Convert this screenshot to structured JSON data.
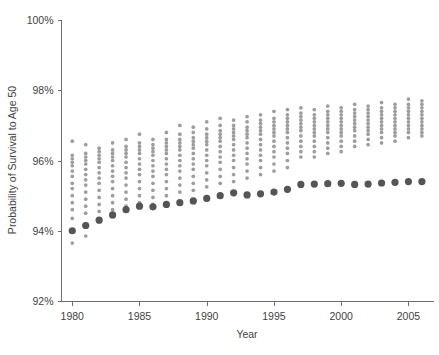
{
  "chart_data": {
    "type": "scatter",
    "title": "",
    "xlabel": "Year",
    "ylabel": "Probability of Survival to Age 50",
    "xlim": [
      1979.2,
      1986.9
    ],
    "ylim": [
      92,
      100
    ],
    "grid": false,
    "legend": "none",
    "x_ticks": [
      1980,
      1985,
      1990,
      1995,
      2000,
      2005
    ],
    "x_tick_labels": [
      "1980",
      "1985",
      "1990",
      "1995",
      "2000",
      "2005"
    ],
    "y_ticks": [
      92,
      94,
      96,
      98,
      100
    ],
    "y_tick_labels": [
      "92%",
      "94%",
      "96%",
      "98%",
      "100%"
    ],
    "x_axis_range": [
      1979.2,
      2006.9
    ],
    "units": "percent",
    "series": [
      {
        "name": "Group values by year",
        "marker": "small-dot",
        "color": "#9d9d9d",
        "points_by_year": {
          "1980": [
            96.55,
            96.15,
            96.05,
            95.95,
            95.85,
            95.7,
            95.55,
            95.35,
            95.2,
            95.0,
            94.8,
            94.6,
            94.35,
            94.0,
            93.65
          ],
          "1981": [
            96.45,
            96.2,
            96.1,
            96.0,
            95.9,
            95.75,
            95.6,
            95.45,
            95.3,
            95.1,
            94.9,
            94.7,
            94.5,
            94.2,
            93.85
          ],
          "1982": [
            96.35,
            96.25,
            96.15,
            96.05,
            95.95,
            95.8,
            95.65,
            95.5,
            95.35,
            95.15,
            94.95,
            94.75,
            94.55,
            94.3
          ],
          "1983": [
            96.5,
            96.3,
            96.2,
            96.1,
            96.0,
            95.85,
            95.7,
            95.55,
            95.4,
            95.2,
            95.0,
            94.8,
            94.6,
            94.4
          ],
          "1984": [
            96.6,
            96.4,
            96.3,
            96.2,
            96.1,
            95.95,
            95.8,
            95.65,
            95.5,
            95.3,
            95.1,
            94.9,
            94.7
          ],
          "1985": [
            96.75,
            96.5,
            96.4,
            96.3,
            96.2,
            96.05,
            95.9,
            95.75,
            95.6,
            95.4,
            95.2,
            95.0,
            94.8
          ],
          "1986": [
            96.6,
            96.45,
            96.35,
            96.25,
            96.15,
            96.0,
            95.85,
            95.7,
            95.55,
            95.35,
            95.15,
            94.95,
            94.75
          ],
          "1987": [
            96.8,
            96.6,
            96.5,
            96.4,
            96.3,
            96.2,
            96.05,
            95.9,
            95.75,
            95.6,
            95.4,
            95.2,
            95.0
          ],
          "1988": [
            97.0,
            96.75,
            96.6,
            96.5,
            96.4,
            96.3,
            96.15,
            96.0,
            95.85,
            95.7,
            95.5,
            95.3,
            95.1
          ],
          "1989": [
            96.95,
            96.8,
            96.65,
            96.55,
            96.45,
            96.35,
            96.2,
            96.05,
            95.9,
            95.75,
            95.55,
            95.35,
            95.15
          ],
          "1990": [
            97.1,
            96.9,
            96.75,
            96.65,
            96.55,
            96.45,
            96.3,
            96.15,
            96.0,
            95.85,
            95.65,
            95.45,
            95.25
          ],
          "1991": [
            97.2,
            97.0,
            96.85,
            96.75,
            96.65,
            96.55,
            96.4,
            96.25,
            96.1,
            95.95,
            95.75,
            95.55,
            95.35
          ],
          "1992": [
            97.15,
            97.0,
            96.9,
            96.8,
            96.7,
            96.6,
            96.45,
            96.3,
            96.15,
            96.0,
            95.8,
            95.6,
            95.4
          ],
          "1993": [
            97.25,
            97.1,
            96.95,
            96.85,
            96.75,
            96.65,
            96.5,
            96.35,
            96.2,
            96.05,
            95.9,
            95.7,
            95.5
          ],
          "1994": [
            97.3,
            97.15,
            97.05,
            96.95,
            96.85,
            96.75,
            96.6,
            96.45,
            96.3,
            96.15,
            96.0,
            95.8,
            95.6
          ],
          "1995": [
            97.4,
            97.2,
            97.1,
            97.0,
            96.9,
            96.8,
            96.7,
            96.55,
            96.4,
            96.25,
            96.1,
            95.9,
            95.7
          ],
          "1996": [
            97.45,
            97.3,
            97.2,
            97.1,
            97.0,
            96.9,
            96.8,
            96.65,
            96.5,
            96.35,
            96.2,
            96.0,
            95.8
          ],
          "1997": [
            97.5,
            97.35,
            97.25,
            97.15,
            97.05,
            96.95,
            96.85,
            96.7,
            96.55,
            96.4,
            96.25,
            96.1
          ],
          "1998": [
            97.45,
            97.3,
            97.2,
            97.1,
            97.0,
            96.9,
            96.8,
            96.7,
            96.55,
            96.4,
            96.25,
            96.1
          ],
          "1999": [
            97.55,
            97.4,
            97.3,
            97.2,
            97.1,
            97.0,
            96.9,
            96.8,
            96.65,
            96.5,
            96.35,
            96.2
          ],
          "2000": [
            97.5,
            97.4,
            97.3,
            97.2,
            97.1,
            97.0,
            96.9,
            96.8,
            96.7,
            96.55,
            96.4,
            96.25
          ],
          "2001": [
            97.6,
            97.45,
            97.35,
            97.25,
            97.15,
            97.05,
            96.95,
            96.85,
            96.7,
            96.55,
            96.4
          ],
          "2002": [
            97.55,
            97.45,
            97.35,
            97.25,
            97.15,
            97.05,
            96.95,
            96.85,
            96.75,
            96.6,
            96.45
          ],
          "2003": [
            97.65,
            97.5,
            97.4,
            97.3,
            97.2,
            97.1,
            97.0,
            96.9,
            96.8,
            96.65,
            96.5
          ],
          "2004": [
            97.6,
            97.5,
            97.4,
            97.3,
            97.2,
            97.1,
            97.0,
            96.9,
            96.8,
            96.7,
            96.55
          ],
          "2005": [
            97.75,
            97.6,
            97.5,
            97.4,
            97.3,
            97.2,
            97.1,
            97.0,
            96.9,
            96.8,
            96.65
          ],
          "2006": [
            97.7,
            97.6,
            97.5,
            97.4,
            97.3,
            97.2,
            97.1,
            97.0,
            96.9,
            96.8,
            96.7
          ]
        }
      },
      {
        "name": "Aggregate (overall)",
        "marker": "large-dot",
        "color": "#555555",
        "x": [
          1980,
          1981,
          1982,
          1983,
          1984,
          1985,
          1986,
          1987,
          1988,
          1989,
          1990,
          1991,
          1992,
          1993,
          1994,
          1995,
          1996,
          1997,
          1998,
          1999,
          2000,
          2001,
          2002,
          2003,
          2004,
          2005,
          2006
        ],
        "values": [
          94.0,
          94.15,
          94.3,
          94.45,
          94.6,
          94.7,
          94.68,
          94.75,
          94.8,
          94.85,
          94.92,
          95.0,
          95.08,
          95.02,
          95.05,
          95.1,
          95.18,
          95.32,
          95.33,
          95.34,
          95.35,
          95.32,
          95.33,
          95.36,
          95.38,
          95.4,
          95.4
        ]
      }
    ]
  },
  "axes": {
    "y_label": "Probability of Survival to Age 50",
    "x_label": "Year",
    "y_tick_labels": [
      "100%",
      "98%",
      "96%",
      "94%",
      "92%"
    ],
    "x_tick_labels": [
      "1980",
      "1985",
      "1990",
      "1995",
      "2000",
      "2005"
    ]
  }
}
